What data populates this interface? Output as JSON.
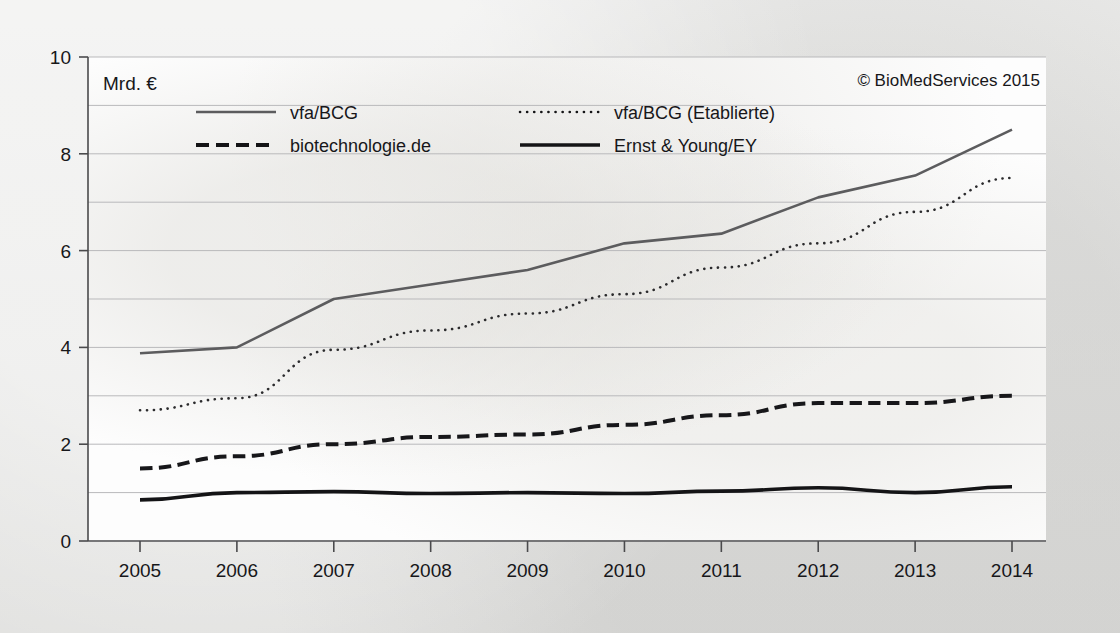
{
  "figure": {
    "unit_label": "Mrd. €",
    "copyright": "© BioMedServices 2015"
  },
  "chart_data": {
    "type": "line",
    "title": "",
    "subtitle": "",
    "xlabel": "",
    "ylabel": "Mrd. €",
    "x": [
      "2005",
      "2006",
      "2007",
      "2008",
      "2009",
      "2010",
      "2011",
      "2012",
      "2013",
      "2014"
    ],
    "categories": [
      "2005",
      "2006",
      "2007",
      "2008",
      "2009",
      "2010",
      "2011",
      "2012",
      "2013",
      "2014"
    ],
    "xlim": [
      2005,
      2014
    ],
    "ylim": [
      0,
      10
    ],
    "ytick_labels": [
      "0",
      "2",
      "4",
      "6",
      "8",
      "10"
    ],
    "ytick_values": [
      0,
      2,
      4,
      6,
      8,
      10
    ],
    "gridline_values": [
      1,
      2,
      3,
      4,
      5,
      6,
      7,
      8,
      9,
      10
    ],
    "grid": true,
    "legend_position": "top-inside",
    "annotations": [
      "Mrd. €",
      "© BioMedServices 2015"
    ],
    "series": [
      {
        "name": "vfa/BCG",
        "style": "solid",
        "color": "#5c5c5e",
        "width": 2.6,
        "values": [
          3.88,
          4.0,
          5.0,
          5.3,
          5.6,
          6.15,
          6.35,
          7.1,
          7.55,
          8.5
        ]
      },
      {
        "name": "vfa/BCG (Etablierte)",
        "style": "dotted",
        "color": "#2b2b2d",
        "width": 2.6,
        "values": [
          2.7,
          2.95,
          3.95,
          4.35,
          4.7,
          5.1,
          5.65,
          6.15,
          6.8,
          7.5
        ]
      },
      {
        "name": "biotechnologie.de",
        "style": "dashed",
        "color": "#17171a",
        "width": 4.0,
        "values": [
          1.5,
          1.75,
          2.0,
          2.15,
          2.2,
          2.4,
          2.6,
          2.85,
          2.85,
          3.0
        ]
      },
      {
        "name": "Ernst & Young/EY",
        "style": "solid",
        "color": "#141416",
        "width": 3.6,
        "values": [
          0.85,
          1.0,
          1.02,
          0.98,
          1.0,
          0.98,
          1.03,
          1.1,
          1.0,
          1.12
        ]
      }
    ]
  },
  "legend": {
    "entries": [
      {
        "label": "vfa/BCG",
        "style": "solid-grey"
      },
      {
        "label": "vfa/BCG (Etablierte)",
        "style": "dotted"
      },
      {
        "label": "biotechnologie.de",
        "style": "dashed"
      },
      {
        "label": "Ernst & Young/EY",
        "style": "solid-black"
      }
    ]
  },
  "colors": {
    "page_background": "#e6e6e4",
    "plot_background": "#fdfdfd",
    "gridline": "#b9b9bb",
    "axis": "#4a4a4c",
    "text": "#17171a",
    "series_grey": "#5c5c5e",
    "series_black": "#141416"
  }
}
